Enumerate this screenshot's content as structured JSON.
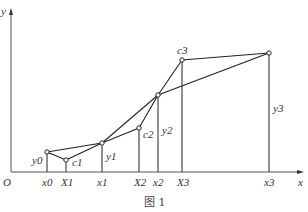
{
  "figure": {
    "caption": "图 1",
    "axes": {
      "x_label": "x",
      "y_label": "y",
      "origin_label": "O"
    },
    "points": [
      {
        "id": "p0",
        "label": "y0",
        "x_label": "x0",
        "px": 47,
        "py": 152
      },
      {
        "id": "c1",
        "label": "c1",
        "x_label": "X1",
        "px": 66,
        "py": 160
      },
      {
        "id": "p1",
        "label": "y1",
        "x_label": "x1",
        "px": 102,
        "py": 143
      },
      {
        "id": "c2",
        "label": "c2",
        "x_label": "X2",
        "px": 139,
        "py": 128
      },
      {
        "id": "p2",
        "label": "y2",
        "x_label": "x2",
        "px": 158,
        "py": 95
      },
      {
        "id": "c3",
        "label": "c3",
        "x_label": "X3",
        "px": 182,
        "py": 60
      },
      {
        "id": "p3",
        "label": "y3",
        "x_label": "x3",
        "px": 269,
        "py": 53
      }
    ],
    "x_tick_labels": [
      "x0",
      "X1",
      "x1",
      "X2",
      "x2",
      "X3",
      "x3"
    ],
    "y_labels": [
      "y0",
      "y1",
      "y2",
      "y3"
    ],
    "control_labels": [
      "c1",
      "c2",
      "c3"
    ]
  }
}
